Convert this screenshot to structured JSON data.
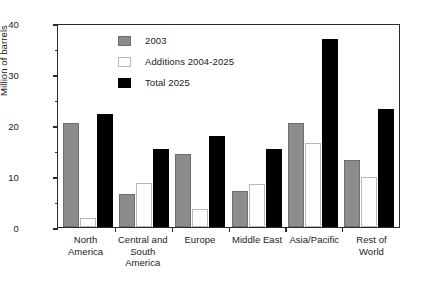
{
  "chart_data": {
    "type": "bar",
    "title": "",
    "xlabel": "",
    "ylabel": "Million of barrels",
    "ylim": [
      0,
      40
    ],
    "yticks": [
      0,
      10,
      20,
      30,
      40
    ],
    "ytick_labels": [
      "0",
      "10",
      "20",
      "30",
      "40"
    ],
    "yminor_ticks": [
      5,
      15,
      25,
      35
    ],
    "grid": false,
    "legend_position": "upper center",
    "categories": [
      "North America",
      "Central and South America",
      "Europe",
      "Middle East",
      "Asia/Pacific",
      "Rest of World"
    ],
    "category_lines": [
      [
        "North",
        "America"
      ],
      [
        "Central and",
        "South",
        "America"
      ],
      [
        "Europe"
      ],
      [
        "Middle East"
      ],
      [
        "Asia/Pacific"
      ],
      [
        "Rest of",
        "World"
      ]
    ],
    "series": [
      {
        "name": "2003",
        "color": "#8c8c8c",
        "values": [
          20.3,
          6.5,
          14.3,
          7.0,
          20.4,
          13.2
        ]
      },
      {
        "name": "Additions 2004-2025",
        "color": "#ffffff",
        "values": [
          1.8,
          8.7,
          3.5,
          8.4,
          16.5,
          9.8
        ]
      },
      {
        "name": "Total 2025",
        "color": "#000000",
        "values": [
          22.2,
          15.2,
          17.8,
          15.3,
          36.8,
          23.2
        ]
      }
    ]
  }
}
